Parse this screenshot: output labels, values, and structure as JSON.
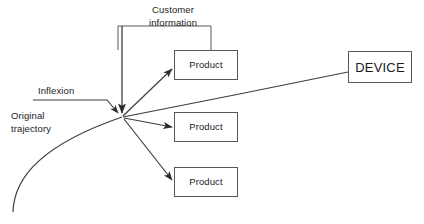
{
  "diagram": {
    "title_labels": {
      "customer_information": "Customer\ninformation",
      "customer_information_line1": "Customer",
      "customer_information_line2": "information",
      "inflexion": "Inflexion",
      "original_trajectory_line1": "Original",
      "original_trajectory_line2": "trajectory"
    },
    "nodes": [
      {
        "id": "product-1",
        "label": "Product",
        "x": 174,
        "y": 50,
        "w": 64,
        "h": 30
      },
      {
        "id": "product-2",
        "label": "Product",
        "x": 174,
        "y": 112,
        "w": 64,
        "h": 30
      },
      {
        "id": "product-3",
        "label": "Product",
        "x": 174,
        "y": 167,
        "w": 64,
        "h": 30
      },
      {
        "id": "device",
        "label": "DEVICE",
        "x": 348,
        "y": 51,
        "w": 64,
        "h": 32
      }
    ],
    "junction": {
      "x": 122,
      "y": 117
    },
    "colors": {
      "stroke": "#3a3d41",
      "box_border": "#55585c",
      "text": "#1b1b1b",
      "background": "#ffffff"
    }
  }
}
